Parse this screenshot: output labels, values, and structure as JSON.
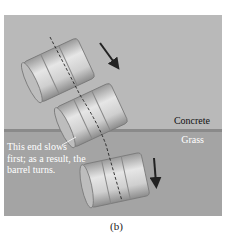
{
  "figure": {
    "caption": "(b)",
    "surfaces": {
      "top": "Concrete",
      "bottom": "Grass"
    },
    "annotation": "This end slows first; as a result, the barrel turns.",
    "colors": {
      "concrete": "#b9b9b9",
      "grass": "#a4a4a4",
      "barrel": "#cfcfcf",
      "arrow": "#222222"
    }
  }
}
